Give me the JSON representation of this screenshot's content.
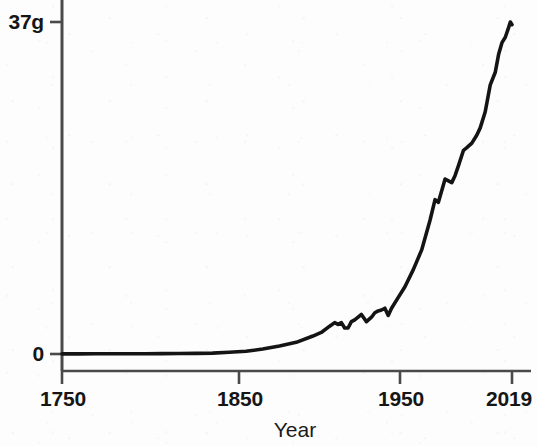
{
  "chart_data": {
    "type": "line",
    "title": "",
    "subtitle": "",
    "xlabel": "Year",
    "ylabel": "",
    "xlim": [
      1750,
      2019
    ],
    "ylim": [
      0,
      37
    ],
    "grid": false,
    "legend": null,
    "y_tick_labels": [
      "0",
      "37g"
    ],
    "y_tick_values": [
      0,
      37
    ],
    "x_tick_labels": [
      "1750",
      "1850",
      "1950",
      "2019"
    ],
    "x_tick_values": [
      1750,
      1850,
      1950,
      2019
    ],
    "line_color": "#141414",
    "axis_color": "#4a4a4a",
    "series": [
      {
        "name": "Global CO2 emissions",
        "units": "gigatonnes",
        "x": [
          1750,
          1760,
          1770,
          1780,
          1790,
          1800,
          1810,
          1820,
          1830,
          1840,
          1850,
          1860,
          1870,
          1880,
          1890,
          1900,
          1905,
          1910,
          1913,
          1915,
          1917,
          1919,
          1921,
          1923,
          1925,
          1927,
          1929,
          1932,
          1935,
          1937,
          1939,
          1941,
          1943,
          1945,
          1947,
          1950,
          1955,
          1960,
          1965,
          1970,
          1973,
          1975,
          1979,
          1981,
          1983,
          1985,
          1987,
          1990,
          1992,
          1995,
          1998,
          2000,
          2003,
          2006,
          2009,
          2011,
          2013,
          2015,
          2017,
          2018,
          2019
        ],
        "values": [
          0.01,
          0.01,
          0.02,
          0.02,
          0.03,
          0.03,
          0.04,
          0.05,
          0.07,
          0.1,
          0.2,
          0.3,
          0.55,
          0.9,
          1.3,
          2.0,
          2.4,
          3.1,
          3.5,
          3.3,
          3.5,
          2.9,
          2.9,
          3.6,
          3.8,
          4.1,
          4.4,
          3.6,
          4.1,
          4.6,
          4.8,
          4.9,
          5.1,
          4.3,
          5.1,
          6.0,
          7.5,
          9.4,
          11.6,
          14.9,
          17.2,
          16.9,
          19.5,
          19.3,
          19.1,
          19.9,
          21.0,
          22.7,
          23.0,
          23.5,
          24.4,
          25.2,
          27.0,
          30.0,
          31.4,
          33.4,
          34.7,
          35.3,
          36.4,
          37.0,
          36.7
        ]
      }
    ],
    "annotations": []
  },
  "axes": {
    "x_title": "Year",
    "y_top_label": "37g",
    "y_bottom_label": "0",
    "x_ticks": [
      {
        "label": "1750"
      },
      {
        "label": "1850"
      },
      {
        "label": "1950"
      },
      {
        "label": "2019"
      }
    ]
  }
}
